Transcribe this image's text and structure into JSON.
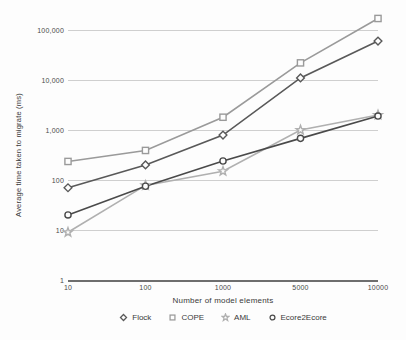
{
  "chart_data": {
    "type": "line",
    "title": "",
    "xlabel": "Number of model elements",
    "ylabel": "Average time taken to migrate (ms)",
    "x_scale": "category",
    "y_scale": "log",
    "ylim": [
      1,
      300000
    ],
    "grid": true,
    "legend_position": "bottom",
    "categories": [
      "10",
      "100",
      "1000",
      "5000",
      "10000"
    ],
    "y_ticks": [
      "1",
      "10",
      "100",
      "1,000",
      "10,000",
      "100,000"
    ],
    "y_tick_values": [
      1,
      10,
      100,
      1000,
      10000,
      100000
    ],
    "series": [
      {
        "name": "Flock",
        "marker": "diamond",
        "color": "#595959",
        "values": [
          70,
          200,
          790,
          11000,
          60000
        ]
      },
      {
        "name": "COPE",
        "marker": "square",
        "color": "#9a9a9a",
        "values": [
          235,
          390,
          1800,
          22000,
          170000
        ]
      },
      {
        "name": "AML",
        "marker": "star",
        "color": "#b0b0b0",
        "values": [
          9,
          78,
          150,
          1000,
          2000
        ]
      },
      {
        "name": "Ecore2Ecore",
        "marker": "circle",
        "color": "#4a4a4a",
        "values": [
          20,
          75,
          240,
          680,
          1900
        ]
      }
    ]
  },
  "legend": {
    "items": [
      {
        "label": "Flock"
      },
      {
        "label": "COPE"
      },
      {
        "label": "AML"
      },
      {
        "label": "Ecore2Ecore"
      }
    ]
  }
}
